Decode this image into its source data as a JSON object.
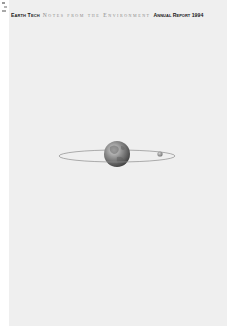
{
  "cover": {
    "brand": "Earth Tech",
    "title": "Notes from the Environment",
    "report_label": "Annual Report 1994"
  },
  "illustration": {
    "subject": "globe-with-orbit-and-moon",
    "icons": [
      "globe-icon",
      "orbit-ring",
      "moon-icon"
    ]
  },
  "colors": {
    "page_background": "#efefef",
    "brand_text": "#1a1a1a",
    "title_text": "#8a8a8a",
    "globe_mid": "#7a7a7a",
    "orbit_line": "#8c8c8c"
  }
}
